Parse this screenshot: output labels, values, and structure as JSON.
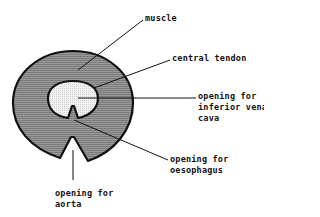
{
  "diagram": {
    "colors": {
      "muscle_fill": "#8c8c8c",
      "tendon_fill": "#e6e6e6",
      "outline": "#111111",
      "background": "#ffffff"
    },
    "labels": {
      "muscle": "muscle",
      "central_tendon": "central tendon",
      "ivc_line1": "opening for",
      "ivc_line2": "inferior vena",
      "ivc_line3": "cava",
      "oesophagus_line1": "opening for",
      "oesophagus_line2": "oesophagus",
      "aorta_line1": "opening for",
      "aorta_line2": "aorta"
    }
  }
}
